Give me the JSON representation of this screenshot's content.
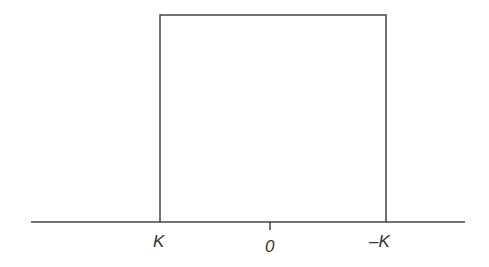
{
  "diagram": {
    "stroke_color": "#444444",
    "axis": {
      "x1": 31,
      "x2": 465,
      "y": 222
    },
    "pulse": {
      "left_x": 160,
      "right_x": 386,
      "top_y": 15
    },
    "center_tick": {
      "x": 270,
      "y1": 222,
      "y2": 230
    },
    "labels": {
      "left": "K",
      "center": "0",
      "right": "–K"
    }
  }
}
